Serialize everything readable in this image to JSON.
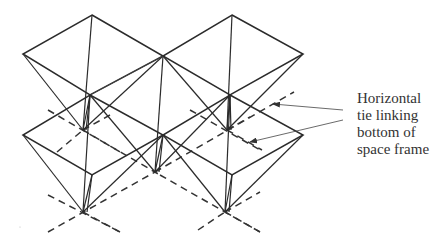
{
  "diagram": {
    "annotation": {
      "lines": [
        "Horizontal",
        "tie linking",
        "bottom of",
        "space frame"
      ],
      "text": "Horizontal\ntie linking\nbottom of\nspace frame",
      "arrow_count": 2
    },
    "elements": {
      "pyramids": 5,
      "top_chord_style": "solid",
      "horizontal_ties_style": "dashed"
    },
    "colors": {
      "line": "#2b2b2b",
      "background": "#ffffff",
      "text": "#333333"
    }
  }
}
